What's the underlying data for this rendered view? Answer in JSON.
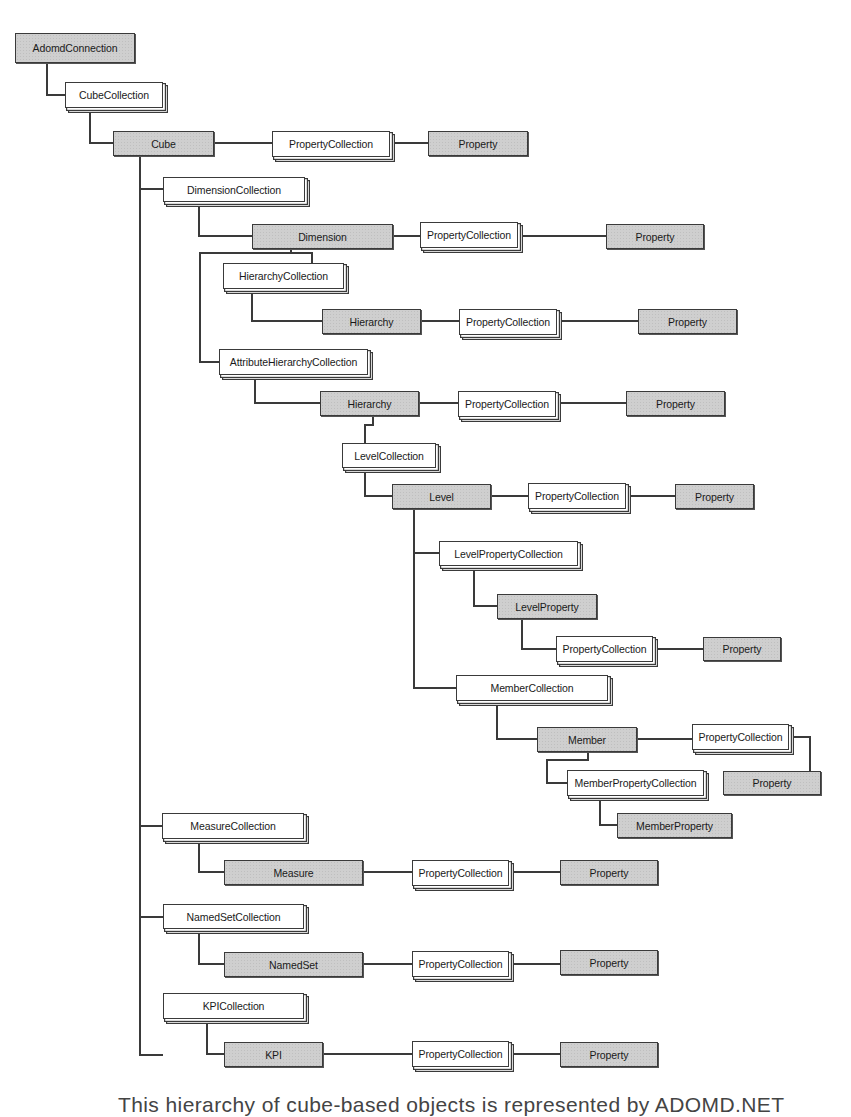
{
  "diagram": {
    "colors": {
      "object_fill": "#cfcfcf",
      "collection_fill": "#ffffff",
      "stroke": "#3a3a3a",
      "background": "#ffffff"
    },
    "legend_semantics": {
      "object": "gray shaded box (single object)",
      "collection": "white stacked box (collection)"
    },
    "nodes": [
      {
        "id": "adomd_connection",
        "label": "AdomdConnection",
        "kind": "object",
        "x": 15,
        "y": 33,
        "w": 120,
        "h": 30
      },
      {
        "id": "cube_collection",
        "label": "CubeCollection",
        "kind": "collection",
        "x": 65,
        "y": 82,
        "w": 98,
        "h": 26
      },
      {
        "id": "cube",
        "label": "Cube",
        "kind": "object",
        "x": 113,
        "y": 131,
        "w": 101,
        "h": 25
      },
      {
        "id": "cube_property_collection",
        "label": "PropertyCollection",
        "kind": "collection",
        "x": 272,
        "y": 131,
        "w": 118,
        "h": 26
      },
      {
        "id": "cube_property",
        "label": "Property",
        "kind": "object",
        "x": 428,
        "y": 131,
        "w": 100,
        "h": 25
      },
      {
        "id": "dimension_collection",
        "label": "DimensionCollection",
        "kind": "collection",
        "x": 163,
        "y": 177,
        "w": 142,
        "h": 25
      },
      {
        "id": "dimension",
        "label": "Dimension",
        "kind": "object",
        "x": 252,
        "y": 224,
        "w": 141,
        "h": 25
      },
      {
        "id": "dimension_property_collection",
        "label": "PropertyCollection",
        "kind": "collection",
        "x": 420,
        "y": 222,
        "w": 98,
        "h": 26
      },
      {
        "id": "dimension_property",
        "label": "Property",
        "kind": "object",
        "x": 606,
        "y": 224,
        "w": 98,
        "h": 25
      },
      {
        "id": "hierarchy_collection",
        "label": "HierarchyCollection",
        "kind": "collection",
        "x": 223,
        "y": 263,
        "w": 121,
        "h": 26
      },
      {
        "id": "hierarchy_1",
        "label": "Hierarchy",
        "kind": "object",
        "x": 322,
        "y": 309,
        "w": 99,
        "h": 25
      },
      {
        "id": "hierarchy_1_property_collection",
        "label": "PropertyCollection",
        "kind": "collection",
        "x": 459,
        "y": 309,
        "w": 98,
        "h": 26
      },
      {
        "id": "hierarchy_1_property",
        "label": "Property",
        "kind": "object",
        "x": 638,
        "y": 309,
        "w": 99,
        "h": 25
      },
      {
        "id": "attribute_hierarchy_collection",
        "label": "AttributeHierarchyCollection",
        "kind": "collection",
        "x": 219,
        "y": 349,
        "w": 149,
        "h": 26
      },
      {
        "id": "hierarchy_2",
        "label": "Hierarchy",
        "kind": "object",
        "x": 320,
        "y": 391,
        "w": 99,
        "h": 25
      },
      {
        "id": "hierarchy_2_property_collection",
        "label": "PropertyCollection",
        "kind": "collection",
        "x": 458,
        "y": 391,
        "w": 98,
        "h": 26
      },
      {
        "id": "hierarchy_2_property",
        "label": "Property",
        "kind": "object",
        "x": 626,
        "y": 391,
        "w": 99,
        "h": 25
      },
      {
        "id": "level_collection",
        "label": "LevelCollection",
        "kind": "collection",
        "x": 342,
        "y": 443,
        "w": 94,
        "h": 25
      },
      {
        "id": "level",
        "label": "Level",
        "kind": "object",
        "x": 392,
        "y": 484,
        "w": 99,
        "h": 25
      },
      {
        "id": "level_property_collection",
        "label": "PropertyCollection",
        "kind": "collection",
        "x": 528,
        "y": 483,
        "w": 98,
        "h": 26
      },
      {
        "id": "level_property",
        "label": "Property",
        "kind": "object",
        "x": 675,
        "y": 484,
        "w": 79,
        "h": 25
      },
      {
        "id": "level_property_collection_2",
        "label": "LevelPropertyCollection",
        "kind": "collection",
        "x": 439,
        "y": 541,
        "w": 139,
        "h": 25
      },
      {
        "id": "level_property_obj",
        "label": "LevelProperty",
        "kind": "object",
        "x": 497,
        "y": 594,
        "w": 100,
        "h": 25
      },
      {
        "id": "level_property_obj_property_collection",
        "label": "PropertyCollection",
        "kind": "collection",
        "x": 556,
        "y": 636,
        "w": 97,
        "h": 26
      },
      {
        "id": "level_property_obj_property",
        "label": "Property",
        "kind": "object",
        "x": 703,
        "y": 637,
        "w": 78,
        "h": 24
      },
      {
        "id": "member_collection",
        "label": "MemberCollection",
        "kind": "collection",
        "x": 456,
        "y": 675,
        "w": 152,
        "h": 26
      },
      {
        "id": "member",
        "label": "Member",
        "kind": "object",
        "x": 537,
        "y": 727,
        "w": 100,
        "h": 25
      },
      {
        "id": "member_property_collection",
        "label": "PropertyCollection",
        "kind": "collection",
        "x": 692,
        "y": 724,
        "w": 97,
        "h": 26
      },
      {
        "id": "member_property",
        "label": "Property",
        "kind": "object",
        "x": 723,
        "y": 771,
        "w": 98,
        "h": 24
      },
      {
        "id": "member_property_collection_2",
        "label": "MemberPropertyCollection",
        "kind": "collection",
        "x": 567,
        "y": 770,
        "w": 137,
        "h": 26
      },
      {
        "id": "member_property_obj",
        "label": "MemberProperty",
        "kind": "object",
        "x": 617,
        "y": 813,
        "w": 115,
        "h": 25
      },
      {
        "id": "measure_collection",
        "label": "MeasureCollection",
        "kind": "collection",
        "x": 162,
        "y": 813,
        "w": 142,
        "h": 26
      },
      {
        "id": "measure",
        "label": "Measure",
        "kind": "object",
        "x": 224,
        "y": 860,
        "w": 139,
        "h": 25
      },
      {
        "id": "measure_property_collection",
        "label": "PropertyCollection",
        "kind": "collection",
        "x": 412,
        "y": 860,
        "w": 97,
        "h": 26
      },
      {
        "id": "measure_property",
        "label": "Property",
        "kind": "object",
        "x": 560,
        "y": 860,
        "w": 98,
        "h": 25
      },
      {
        "id": "named_set_collection",
        "label": "NamedSetCollection",
        "kind": "collection",
        "x": 163,
        "y": 904,
        "w": 141,
        "h": 25
      },
      {
        "id": "named_set",
        "label": "NamedSet",
        "kind": "object",
        "x": 224,
        "y": 952,
        "w": 139,
        "h": 25
      },
      {
        "id": "named_set_property_collection",
        "label": "PropertyCollection",
        "kind": "collection",
        "x": 412,
        "y": 951,
        "w": 97,
        "h": 26
      },
      {
        "id": "named_set_property",
        "label": "Property",
        "kind": "object",
        "x": 560,
        "y": 950,
        "w": 98,
        "h": 25
      },
      {
        "id": "kpi_collection",
        "label": "KPICollection",
        "kind": "collection",
        "x": 163,
        "y": 993,
        "w": 141,
        "h": 26
      },
      {
        "id": "kpi",
        "label": "KPI",
        "kind": "object",
        "x": 224,
        "y": 1042,
        "w": 99,
        "h": 25
      },
      {
        "id": "kpi_property_collection",
        "label": "PropertyCollection",
        "kind": "collection",
        "x": 412,
        "y": 1041,
        "w": 97,
        "h": 26
      },
      {
        "id": "kpi_property",
        "label": "Property",
        "kind": "object",
        "x": 560,
        "y": 1042,
        "w": 98,
        "h": 25
      }
    ],
    "edges": [
      {
        "from": "adomd_connection",
        "to": "cube_collection",
        "points": [
          [
            47,
            63
          ],
          [
            47,
            95
          ],
          [
            65,
            95
          ]
        ]
      },
      {
        "from": "cube_collection",
        "to": "cube",
        "points": [
          [
            90,
            108
          ],
          [
            90,
            143
          ],
          [
            113,
            143
          ]
        ]
      },
      {
        "from": "cube",
        "to": "cube_property_collection",
        "points": [
          [
            214,
            143
          ],
          [
            272,
            143
          ]
        ]
      },
      {
        "from": "cube_property_collection",
        "to": "cube_property",
        "points": [
          [
            394,
            143
          ],
          [
            428,
            143
          ]
        ]
      },
      {
        "from": "cube",
        "to": "dimension_collection",
        "points": [
          [
            140,
            156
          ],
          [
            140,
            1055
          ],
          [
            163,
            1055
          ]
        ],
        "note": "trunk"
      },
      {
        "from": "cube_trunk",
        "to": "dimension_collection",
        "points": [
          [
            140,
            189
          ],
          [
            163,
            189
          ]
        ]
      },
      {
        "from": "dimension_collection",
        "to": "dimension",
        "points": [
          [
            199,
            202
          ],
          [
            199,
            236
          ],
          [
            252,
            236
          ]
        ]
      },
      {
        "from": "dimension",
        "to": "dimension_property_collection",
        "points": [
          [
            393,
            236
          ],
          [
            420,
            236
          ]
        ]
      },
      {
        "from": "dimension_property_collection",
        "to": "dimension_property",
        "points": [
          [
            522,
            236
          ],
          [
            606,
            236
          ]
        ]
      },
      {
        "from": "dimension",
        "to": "hierarchy_collection",
        "points": [
          [
            291,
            249
          ],
          [
            291,
            253
          ],
          [
            312,
            253
          ],
          [
            312,
            263
          ]
        ]
      },
      {
        "from": "dimension",
        "to": "attribute_hierarchy_collection",
        "points": [
          [
            291,
            253
          ],
          [
            200,
            253
          ],
          [
            200,
            362
          ],
          [
            219,
            362
          ]
        ]
      },
      {
        "from": "hierarchy_collection",
        "to": "hierarchy_1",
        "points": [
          [
            252,
            289
          ],
          [
            252,
            321
          ],
          [
            322,
            321
          ]
        ]
      },
      {
        "from": "hierarchy_1",
        "to": "hierarchy_1_property_collection",
        "points": [
          [
            421,
            321
          ],
          [
            459,
            321
          ]
        ]
      },
      {
        "from": "hierarchy_1_property_collection",
        "to": "hierarchy_1_property",
        "points": [
          [
            561,
            321
          ],
          [
            638,
            321
          ]
        ]
      },
      {
        "from": "attribute_hierarchy_collection",
        "to": "hierarchy_2",
        "points": [
          [
            255,
            375
          ],
          [
            255,
            403
          ],
          [
            320,
            403
          ]
        ]
      },
      {
        "from": "hierarchy_2",
        "to": "hierarchy_2_property_collection",
        "points": [
          [
            419,
            403
          ],
          [
            458,
            403
          ]
        ]
      },
      {
        "from": "hierarchy_2_property_collection",
        "to": "hierarchy_2_property",
        "points": [
          [
            560,
            403
          ],
          [
            626,
            403
          ]
        ]
      },
      {
        "from": "hierarchy_2",
        "to": "level_collection",
        "points": [
          [
            373,
            416
          ],
          [
            373,
            425
          ],
          [
            365,
            425
          ],
          [
            365,
            443
          ]
        ]
      },
      {
        "from": "level_collection",
        "to": "level",
        "points": [
          [
            365,
            468
          ],
          [
            365,
            496
          ],
          [
            392,
            496
          ]
        ]
      },
      {
        "from": "level",
        "to": "level_property_collection",
        "points": [
          [
            491,
            496
          ],
          [
            528,
            496
          ]
        ]
      },
      {
        "from": "level_property_collection",
        "to": "level_property",
        "points": [
          [
            630,
            496
          ],
          [
            675,
            496
          ]
        ]
      },
      {
        "from": "level",
        "to": "member_collection",
        "points": [
          [
            414,
            509
          ],
          [
            414,
            688
          ],
          [
            456,
            688
          ]
        ],
        "note": "level trunk"
      },
      {
        "from": "level_trunk",
        "to": "level_property_collection_2",
        "points": [
          [
            414,
            553
          ],
          [
            439,
            553
          ]
        ]
      },
      {
        "from": "level_property_collection_2",
        "to": "level_property_obj",
        "points": [
          [
            474,
            566
          ],
          [
            474,
            606
          ],
          [
            497,
            606
          ]
        ]
      },
      {
        "from": "level_property_obj",
        "to": "level_property_obj_property_collection",
        "points": [
          [
            522,
            619
          ],
          [
            522,
            649
          ],
          [
            556,
            649
          ]
        ]
      },
      {
        "from": "level_property_obj_property_collection",
        "to": "level_property_obj_property",
        "points": [
          [
            657,
            649
          ],
          [
            703,
            649
          ]
        ]
      },
      {
        "from": "member_collection",
        "to": "member",
        "points": [
          [
            497,
            701
          ],
          [
            497,
            739
          ],
          [
            537,
            739
          ]
        ]
      },
      {
        "from": "member",
        "to": "member_property_collection",
        "points": [
          [
            637,
            739
          ],
          [
            692,
            739
          ]
        ]
      },
      {
        "from": "member_property_collection",
        "to": "member_property",
        "points": [
          [
            793,
            737
          ],
          [
            810,
            737
          ],
          [
            810,
            771
          ]
        ]
      },
      {
        "from": "member",
        "to": "member_property_collection_2",
        "points": [
          [
            588,
            752
          ],
          [
            588,
            760
          ],
          [
            547,
            760
          ],
          [
            547,
            783
          ],
          [
            567,
            783
          ]
        ]
      },
      {
        "from": "member_property_collection_2",
        "to": "member_property_obj",
        "points": [
          [
            600,
            796
          ],
          [
            600,
            825
          ],
          [
            617,
            825
          ]
        ]
      },
      {
        "from": "cube_trunk",
        "to": "measure_collection",
        "points": [
          [
            140,
            826
          ],
          [
            162,
            826
          ]
        ]
      },
      {
        "from": "measure_collection",
        "to": "measure",
        "points": [
          [
            199,
            839
          ],
          [
            199,
            872
          ],
          [
            224,
            872
          ]
        ]
      },
      {
        "from": "measure",
        "to": "measure_property_collection",
        "points": [
          [
            363,
            872
          ],
          [
            412,
            872
          ]
        ]
      },
      {
        "from": "measure_property_collection",
        "to": "measure_property",
        "points": [
          [
            513,
            872
          ],
          [
            560,
            872
          ]
        ]
      },
      {
        "from": "cube_trunk",
        "to": "named_set_collection",
        "points": [
          [
            140,
            917
          ],
          [
            163,
            917
          ]
        ]
      },
      {
        "from": "named_set_collection",
        "to": "named_set",
        "points": [
          [
            199,
            929
          ],
          [
            199,
            964
          ],
          [
            224,
            964
          ]
        ]
      },
      {
        "from": "named_set",
        "to": "named_set_property_collection",
        "points": [
          [
            363,
            964
          ],
          [
            412,
            964
          ]
        ]
      },
      {
        "from": "named_set_property_collection",
        "to": "named_set_property",
        "points": [
          [
            513,
            964
          ],
          [
            560,
            964
          ]
        ]
      },
      {
        "from": "kpi_collection",
        "to": "kpi",
        "points": [
          [
            207,
            1019
          ],
          [
            207,
            1054
          ],
          [
            224,
            1054
          ]
        ]
      },
      {
        "from": "kpi",
        "to": "kpi_property_collection",
        "points": [
          [
            323,
            1054
          ],
          [
            412,
            1054
          ]
        ]
      },
      {
        "from": "kpi_property_collection",
        "to": "kpi_property",
        "points": [
          [
            513,
            1054
          ],
          [
            560,
            1054
          ]
        ]
      }
    ]
  },
  "caption": {
    "text": "This hierarchy of cube-based objects is represented by ADOMD.NET"
  }
}
